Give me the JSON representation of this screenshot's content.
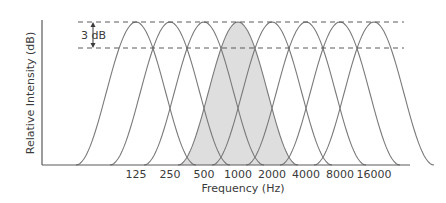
{
  "chart_data": {
    "type": "line",
    "title": "",
    "xlabel": "Frequency (Hz)",
    "ylabel": "Relative Intensity (dB)",
    "categories": [
      "125",
      "250",
      "500",
      "1000",
      "2000",
      "4000",
      "8000",
      "16000"
    ],
    "series": [
      {
        "name": "125 Hz band",
        "center": 125,
        "peak": 0,
        "shaded": false
      },
      {
        "name": "250 Hz band",
        "center": 250,
        "peak": 0,
        "shaded": false
      },
      {
        "name": "500 Hz band",
        "center": 500,
        "peak": 0,
        "shaded": false
      },
      {
        "name": "1000 Hz band",
        "center": 1000,
        "peak": 0,
        "shaded": true
      },
      {
        "name": "2000 Hz band",
        "center": 2000,
        "peak": 0,
        "shaded": false
      },
      {
        "name": "4000 Hz band",
        "center": 4000,
        "peak": 0,
        "shaded": false
      },
      {
        "name": "8000 Hz band",
        "center": 8000,
        "peak": 0,
        "shaded": false
      },
      {
        "name": "16000 Hz band",
        "center": 16000,
        "peak": 0,
        "shaded": false
      }
    ],
    "annotations": [
      {
        "text": "3 dB",
        "type": "double-arrow",
        "between": [
          "peak level",
          "-3 dB crossover level"
        ]
      }
    ],
    "reference_lines": [
      {
        "label": "peak level",
        "style": "dashed"
      },
      {
        "label": "-3 dB crossover level",
        "style": "dashed"
      }
    ],
    "grid": false,
    "legend": null,
    "x_scale": "log (octave)",
    "y_ticks": "none"
  },
  "labels": {
    "xlabel": "Frequency (Hz)",
    "ylabel": "Relative Intensity (dB)",
    "annotation": "3 dB",
    "ticks": [
      "125",
      "250",
      "500",
      "1000",
      "2000",
      "4000",
      "8000",
      "16000"
    ]
  },
  "colors": {
    "curve": "#7a7a7a",
    "shade": "#dedede",
    "axis": "#5a5a5a",
    "dash": "#5a5a5a",
    "text": "#3a3a3a"
  }
}
